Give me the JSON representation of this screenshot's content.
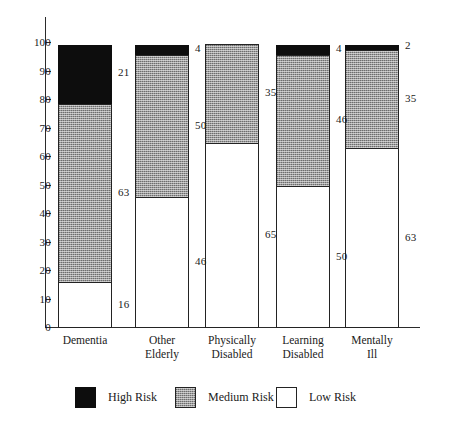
{
  "chart_data": {
    "type": "bar",
    "subtype": "stacked-bar-100",
    "title": "",
    "xlabel": "",
    "ylabel": "",
    "ylim": [
      0,
      100
    ],
    "grid": false,
    "legend_position": "bottom",
    "categories": [
      "Dementia",
      "Other Elderly",
      "Physically Disabled",
      "Learning Disabled",
      "Mentally Ill"
    ],
    "category_lines": [
      [
        "Dementia",
        ""
      ],
      [
        "Other",
        "Elderly"
      ],
      [
        "Physically",
        "Disabled"
      ],
      [
        "Learning",
        "Disabled"
      ],
      [
        "Mentally",
        "Ill"
      ]
    ],
    "series": [
      {
        "name": "High Risk",
        "color": "#0d0d0d",
        "values": [
          21,
          4,
          0,
          4,
          2
        ]
      },
      {
        "name": "Medium Risk",
        "color": "#9b9b9b",
        "values": [
          63,
          50,
          35,
          46,
          35
        ]
      },
      {
        "name": "Low Risk",
        "color": "#ffffff",
        "values": [
          16,
          46,
          65,
          50,
          63
        ]
      }
    ],
    "y_ticks": [
      0,
      10,
      20,
      30,
      40,
      50,
      60,
      70,
      80,
      90,
      100
    ],
    "y_tick_labels": [
      "0",
      "10",
      "20",
      "30",
      "40",
      "50",
      "60",
      "70",
      "80",
      "90",
      "100"
    ],
    "data_labels": [
      {
        "category": "Dementia",
        "series": "High Risk",
        "text": "21"
      },
      {
        "category": "Dementia",
        "series": "Medium Risk",
        "text": "63"
      },
      {
        "category": "Dementia",
        "series": "Low Risk",
        "text": "16"
      },
      {
        "category": "Other Elderly",
        "series": "High Risk",
        "text": "4"
      },
      {
        "category": "Other Elderly",
        "series": "Medium Risk",
        "text": "50"
      },
      {
        "category": "Other Elderly",
        "series": "Low Risk",
        "text": "46"
      },
      {
        "category": "Physically Disabled",
        "series": "Medium Risk",
        "text": "35"
      },
      {
        "category": "Physically Disabled",
        "series": "Low Risk",
        "text": "65"
      },
      {
        "category": "Learning Disabled",
        "series": "High Risk",
        "text": "4"
      },
      {
        "category": "Learning Disabled",
        "series": "Medium Risk",
        "text": "46"
      },
      {
        "category": "Learning Disabled",
        "series": "Low Risk",
        "text": "50"
      },
      {
        "category": "Mentally Ill",
        "series": "High Risk",
        "text": "2"
      },
      {
        "category": "Mentally Ill",
        "series": "Medium Risk",
        "text": "35"
      },
      {
        "category": "Mentally Ill",
        "series": "Low Risk",
        "text": "63"
      }
    ]
  },
  "legend": {
    "items": [
      {
        "label": "High Risk",
        "swatch": "high"
      },
      {
        "label": "Medium Risk",
        "swatch": "medium"
      },
      {
        "label": "Low Risk",
        "swatch": "low"
      }
    ]
  },
  "colors": {
    "high_risk": "#0d0d0d",
    "medium_risk": "#9b9b9b",
    "low_risk": "#ffffff",
    "axis": "#2b2b2b",
    "text": "#1a1a1a",
    "background": "#ffffff"
  }
}
